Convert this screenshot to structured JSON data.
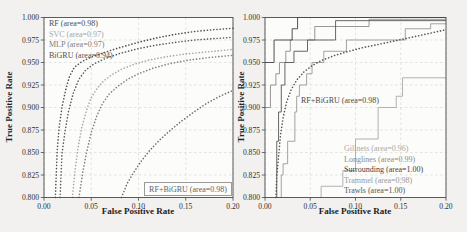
{
  "figure": {
    "left_plot": {
      "xlabel": "False Positive Rate",
      "ylabel": "True Positive Rate",
      "annotation": {
        "label": "RF+BiGRU (area=0.98)",
        "color": "#636363"
      },
      "legend": [
        {
          "label": "RF (area=0.98)",
          "color": "#4f4f4f"
        },
        {
          "label": "SVC (area=0.97)",
          "color": "#a6a6a6"
        },
        {
          "label": "MLP (area=0.97)",
          "color": "#7f7f7f"
        },
        {
          "label": "BiGRU (area=0.94)",
          "color": "#525252"
        }
      ]
    },
    "right_plot": {
      "xlabel": "False Positive Rate",
      "ylabel": "True Positive Rate",
      "annotation": {
        "label": "RF+BiGRU (area=0.98)",
        "color": "#4a4a4a"
      },
      "legend": [
        {
          "label": "Gillnets (area=0.96)",
          "color": "#a9a9a9"
        },
        {
          "label": "Longlines (area=0.99)",
          "color": "#8c8c8c"
        },
        {
          "label": "Surrounding (area=1.00)",
          "color": "#3f3f3f"
        },
        {
          "label": "Trammel (area=0.98)",
          "color": "#999999"
        },
        {
          "label": "Trawls (area=1.00)",
          "color": "#555555"
        }
      ]
    }
  },
  "chart_data": [
    {
      "type": "line",
      "title": "",
      "xlabel": "False Positive Rate",
      "ylabel": "True Positive Rate",
      "xlim": [
        0.0,
        0.2
      ],
      "ylim": [
        0.8,
        1.0
      ],
      "xticks": [
        "0.00",
        "0.05",
        "0.10",
        "0.15",
        "0.20"
      ],
      "yticks": [
        "0.800",
        "0.825",
        "0.850",
        "0.875",
        "0.900",
        "0.925",
        "0.950",
        "0.975",
        "1.000"
      ],
      "grid": true,
      "legend_position": "upper left",
      "series": [
        {
          "name": "RF",
          "area": 0.98,
          "style": "dotted",
          "color": "#4f4f4f",
          "points": [
            [
              0.012,
              0.8
            ],
            [
              0.014,
              0.853
            ],
            [
              0.016,
              0.878
            ],
            [
              0.019,
              0.9
            ],
            [
              0.023,
              0.92
            ],
            [
              0.027,
              0.9345
            ],
            [
              0.032,
              0.9445
            ],
            [
              0.04,
              0.951
            ],
            [
              0.05,
              0.956
            ],
            [
              0.065,
              0.9615
            ],
            [
              0.08,
              0.9665
            ],
            [
              0.1,
              0.9725
            ],
            [
              0.12,
              0.9775
            ],
            [
              0.14,
              0.9815
            ],
            [
              0.16,
              0.9845
            ],
            [
              0.18,
              0.9865
            ],
            [
              0.2,
              0.988
            ]
          ]
        },
        {
          "name": "SVC",
          "area": 0.97,
          "style": "dotted",
          "color": "#a6a6a6",
          "points": [
            [
              0.03,
              0.8
            ],
            [
              0.033,
              0.832
            ],
            [
              0.036,
              0.855
            ],
            [
              0.04,
              0.878
            ],
            [
              0.045,
              0.897
            ],
            [
              0.05,
              0.911
            ],
            [
              0.056,
              0.921
            ],
            [
              0.063,
              0.9295
            ],
            [
              0.072,
              0.9365
            ],
            [
              0.082,
              0.9425
            ],
            [
              0.095,
              0.948
            ],
            [
              0.11,
              0.9525
            ],
            [
              0.13,
              0.9565
            ],
            [
              0.15,
              0.9595
            ],
            [
              0.175,
              0.962
            ],
            [
              0.2,
              0.9645
            ]
          ]
        },
        {
          "name": "MLP",
          "area": 0.97,
          "style": "dotted",
          "color": "#7f7f7f",
          "points": [
            [
              0.037,
              0.8
            ],
            [
              0.041,
              0.828
            ],
            [
              0.045,
              0.85
            ],
            [
              0.05,
              0.872
            ],
            [
              0.056,
              0.891
            ],
            [
              0.062,
              0.9045
            ],
            [
              0.069,
              0.915
            ],
            [
              0.078,
              0.9235
            ],
            [
              0.088,
              0.931
            ],
            [
              0.1,
              0.9375
            ],
            [
              0.115,
              0.9435
            ],
            [
              0.132,
              0.9485
            ],
            [
              0.152,
              0.9525
            ],
            [
              0.175,
              0.9555
            ],
            [
              0.2,
              0.958
            ]
          ]
        },
        {
          "name": "BiGRU",
          "area": 0.94,
          "style": "dotted",
          "color": "#6b6b6b",
          "points": [
            [
              0.082,
              0.8
            ],
            [
              0.088,
              0.8155
            ],
            [
              0.095,
              0.828
            ],
            [
              0.103,
              0.8405
            ],
            [
              0.112,
              0.8525
            ],
            [
              0.122,
              0.8635
            ],
            [
              0.133,
              0.874
            ],
            [
              0.145,
              0.8845
            ],
            [
              0.158,
              0.8945
            ],
            [
              0.172,
              0.9045
            ],
            [
              0.186,
              0.9125
            ],
            [
              0.2,
              0.919
            ]
          ]
        },
        {
          "name": "RF+BiGRU",
          "area": 0.98,
          "style": "dotted",
          "color": "#5a5a5a",
          "points": [
            [
              0.017,
              0.8
            ],
            [
              0.019,
              0.848
            ],
            [
              0.022,
              0.872
            ],
            [
              0.026,
              0.896
            ],
            [
              0.031,
              0.916
            ],
            [
              0.037,
              0.9315
            ],
            [
              0.044,
              0.9415
            ],
            [
              0.053,
              0.9485
            ],
            [
              0.065,
              0.9545
            ],
            [
              0.08,
              0.96
            ],
            [
              0.1,
              0.9655
            ],
            [
              0.12,
              0.9695
            ],
            [
              0.14,
              0.9725
            ],
            [
              0.16,
              0.975
            ],
            [
              0.18,
              0.9765
            ],
            [
              0.2,
              0.978
            ]
          ]
        }
      ]
    },
    {
      "type": "line",
      "title": "",
      "xlabel": "False Positive Rate",
      "ylabel": "True Positive Rate",
      "xlim": [
        0.0,
        0.2
      ],
      "ylim": [
        0.8,
        1.0
      ],
      "xticks": [
        "0.00",
        "0.05",
        "0.10",
        "0.15",
        "0.20"
      ],
      "yticks": [
        "0.800",
        "0.825",
        "0.850",
        "0.875",
        "0.900",
        "0.925",
        "0.950",
        "0.975",
        "1.000"
      ],
      "grid": true,
      "legend_position": "lower right",
      "series": [
        {
          "name": "Gillnets",
          "area": 0.96,
          "style": "step",
          "color": "#a9a9a9",
          "points": [
            [
              0.062,
              0.8
            ],
            [
              0.062,
              0.8125
            ],
            [
              0.086,
              0.8125
            ],
            [
              0.086,
              0.83
            ],
            [
              0.1,
              0.83
            ],
            [
              0.1,
              0.865
            ],
            [
              0.125,
              0.865
            ],
            [
              0.125,
              0.9
            ],
            [
              0.145,
              0.9
            ],
            [
              0.145,
              0.9125
            ],
            [
              0.152,
              0.9125
            ],
            [
              0.152,
              0.933
            ],
            [
              0.2,
              0.933
            ]
          ]
        },
        {
          "name": "Longlines",
          "area": 0.99,
          "style": "step",
          "color": "#8c8c8c",
          "points": [
            [
              0.0,
              0.9
            ],
            [
              0.006,
              0.9
            ],
            [
              0.006,
              0.925
            ],
            [
              0.012,
              0.925
            ],
            [
              0.012,
              0.9375
            ],
            [
              0.016,
              0.9375
            ],
            [
              0.016,
              0.95
            ],
            [
              0.023,
              0.95
            ],
            [
              0.023,
              0.9625
            ],
            [
              0.028,
              0.9625
            ],
            [
              0.028,
              0.975
            ],
            [
              0.055,
              0.975
            ],
            [
              0.055,
              0.99
            ],
            [
              0.115,
              0.99
            ],
            [
              0.115,
              0.998
            ],
            [
              0.2,
              0.998
            ]
          ]
        },
        {
          "name": "Surrounding",
          "area": 1.0,
          "style": "step",
          "color": "#3f3f3f",
          "points": [
            [
              0.0,
              0.95
            ],
            [
              0.01,
              0.95
            ],
            [
              0.01,
              0.975
            ],
            [
              0.03,
              0.975
            ],
            [
              0.03,
              0.9875
            ],
            [
              0.036,
              0.9875
            ],
            [
              0.036,
              1.0
            ],
            [
              0.2,
              1.0
            ]
          ]
        },
        {
          "name": "Trammel",
          "area": 0.98,
          "style": "step",
          "color": "#999999",
          "points": [
            [
              0.018,
              0.8
            ],
            [
              0.018,
              0.825
            ],
            [
              0.02,
              0.825
            ],
            [
              0.02,
              0.8375
            ],
            [
              0.025,
              0.8375
            ],
            [
              0.025,
              0.8625
            ],
            [
              0.033,
              0.8625
            ],
            [
              0.033,
              0.895
            ],
            [
              0.035,
              0.895
            ],
            [
              0.035,
              0.9125
            ],
            [
              0.038,
              0.9125
            ],
            [
              0.038,
              0.925
            ],
            [
              0.046,
              0.925
            ],
            [
              0.046,
              0.9375
            ],
            [
              0.052,
              0.9375
            ],
            [
              0.052,
              0.95
            ],
            [
              0.065,
              0.95
            ],
            [
              0.065,
              0.9625
            ],
            [
              0.09,
              0.9625
            ],
            [
              0.09,
              0.975
            ],
            [
              0.155,
              0.975
            ],
            [
              0.155,
              0.9875
            ],
            [
              0.183,
              0.9875
            ],
            [
              0.183,
              0.993
            ],
            [
              0.2,
              0.993
            ]
          ]
        },
        {
          "name": "Trawls",
          "area": 1.0,
          "style": "step",
          "color": "#555555",
          "points": [
            [
              0.013,
              0.8
            ],
            [
              0.013,
              0.8625
            ],
            [
              0.015,
              0.8625
            ],
            [
              0.015,
              0.895
            ],
            [
              0.018,
              0.895
            ],
            [
              0.018,
              0.925
            ],
            [
              0.022,
              0.925
            ],
            [
              0.022,
              0.95
            ],
            [
              0.032,
              0.95
            ],
            [
              0.032,
              0.9625
            ],
            [
              0.047,
              0.9625
            ],
            [
              0.047,
              0.975
            ],
            [
              0.078,
              0.975
            ],
            [
              0.078,
              0.9965
            ],
            [
              0.2,
              0.9965
            ]
          ]
        },
        {
          "name": "RF+BiGRU",
          "area": 0.98,
          "style": "dotted",
          "color": "#565656",
          "points": [
            [
              0.012,
              0.8
            ],
            [
              0.013,
              0.8235
            ],
            [
              0.015,
              0.8455
            ],
            [
              0.017,
              0.868
            ],
            [
              0.02,
              0.889
            ],
            [
              0.024,
              0.9065
            ],
            [
              0.029,
              0.92
            ],
            [
              0.035,
              0.9305
            ],
            [
              0.043,
              0.9395
            ],
            [
              0.052,
              0.9465
            ],
            [
              0.063,
              0.9525
            ],
            [
              0.076,
              0.9575
            ],
            [
              0.091,
              0.962
            ],
            [
              0.108,
              0.9665
            ],
            [
              0.127,
              0.9705
            ],
            [
              0.148,
              0.975
            ],
            [
              0.171,
              0.98
            ],
            [
              0.2,
              0.9865
            ]
          ]
        }
      ]
    }
  ]
}
